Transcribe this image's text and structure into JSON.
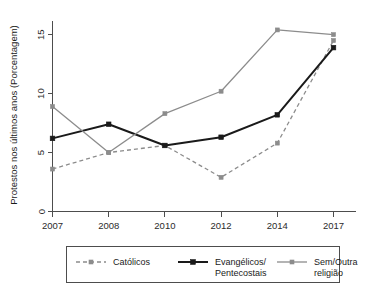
{
  "chart_data": {
    "type": "line",
    "title": "",
    "xlabel": "",
    "ylabel": "Protestos nos últimos anos (Porcentagem)",
    "categories": [
      "2007",
      "2008",
      "2010",
      "2012",
      "2014",
      "2017"
    ],
    "x_tick_labels": [
      "2007",
      "2008",
      "2010",
      "2012",
      "2014",
      "2017"
    ],
    "y_tick_labels": [
      "0",
      "5",
      "10",
      "15"
    ],
    "y_ticks": [
      0,
      5,
      10,
      15
    ],
    "ylim": [
      0,
      16.2
    ],
    "grid": false,
    "legend_position": "below",
    "series": [
      {
        "name": "Católicos",
        "values": [
          3.6,
          5.0,
          5.6,
          2.9,
          5.8,
          14.5
        ],
        "color": "#8c8c8c",
        "style": "dashed",
        "width": 1.3,
        "marker": "square"
      },
      {
        "name": "Evangélicos/\nPentecostais",
        "legend_line_1": "Evangélicos/",
        "legend_line_2": "Pentecostais",
        "values": [
          6.2,
          7.4,
          5.6,
          6.3,
          8.2,
          13.9
        ],
        "color": "#1a1a1a",
        "style": "solid",
        "width": 2.0,
        "marker": "square"
      },
      {
        "name": "Sem/Outra religião",
        "legend_line_1": "Sem/Outra",
        "legend_line_2": "religião",
        "values": [
          8.9,
          5.0,
          8.3,
          10.2,
          15.4,
          15.0
        ],
        "color": "#8c8c8c",
        "style": "solid",
        "width": 1.3,
        "marker": "square"
      }
    ]
  },
  "legend": {
    "entries": [
      {
        "label": "Católicos",
        "label_2": ""
      },
      {
        "label": "Evangélicos/",
        "label_2": "Pentecostais"
      },
      {
        "label": "Sem/Outra",
        "label_2": "religião"
      }
    ]
  },
  "axes": {
    "y_title": "Protestos nos últimos anos (Porcentagem)"
  }
}
